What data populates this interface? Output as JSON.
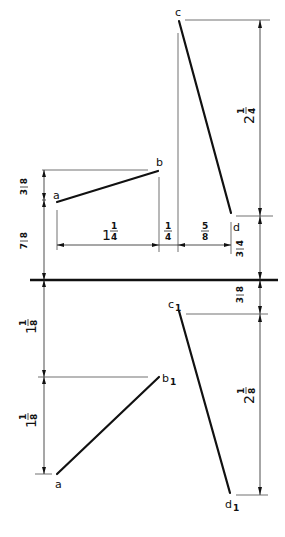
{
  "diagram": {
    "type": "orthographic-projection",
    "ground_line": {
      "y": 280,
      "x1": 30,
      "x2": 278
    },
    "top_view": {
      "points": {
        "a": {
          "label": "a",
          "x": 57,
          "y": 202
        },
        "b": {
          "label": "b",
          "x": 158,
          "y": 171
        },
        "c": {
          "label": "c",
          "x": 179,
          "y": 21
        },
        "d": {
          "label": "d",
          "x": 231,
          "y": 213
        }
      },
      "lines": [
        {
          "from": "a",
          "to": "b"
        },
        {
          "from": "c",
          "to": "d"
        }
      ]
    },
    "front_view": {
      "points": {
        "a": {
          "label": "a",
          "x": 57,
          "y": 474
        },
        "b1": {
          "label": "b",
          "sub": "1",
          "x": 159,
          "y": 377
        },
        "c1": {
          "label": "c",
          "sub": "1",
          "x": 179,
          "y": 311
        },
        "d1": {
          "label": "d",
          "sub": "1",
          "x": 230,
          "y": 493
        }
      },
      "lines": [
        {
          "from": "a",
          "to": "b1"
        },
        {
          "from": "c1",
          "to": "d1"
        }
      ]
    },
    "dimensions": {
      "left_top_upper": {
        "whole": "",
        "num": "3",
        "den": "8"
      },
      "left_top_lower": {
        "whole": "",
        "num": "7",
        "den": "8"
      },
      "bottom_ab": {
        "whole": "1",
        "num": "1",
        "den": "4"
      },
      "bottom_gap": {
        "whole": "",
        "num": "1",
        "den": "4"
      },
      "bottom_cd": {
        "whole": "",
        "num": "5",
        "den": "8"
      },
      "right_cd": {
        "whole": "2",
        "num": "1",
        "den": "4"
      },
      "right_d_to_ground": {
        "whole": "",
        "num": "3",
        "den": "4"
      },
      "right_ground_to_c1": {
        "whole": "",
        "num": "3",
        "den": "8"
      },
      "right_c1_d1": {
        "whole": "2",
        "num": "1",
        "den": "8"
      },
      "left_front_upper": {
        "whole": "1",
        "num": "1",
        "den": "8"
      },
      "left_front_lower": {
        "whole": "1",
        "num": "1",
        "den": "8"
      }
    }
  }
}
